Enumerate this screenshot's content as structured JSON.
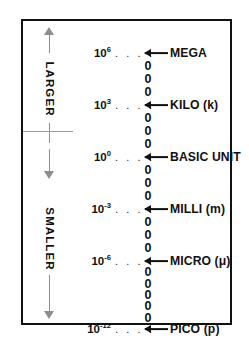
{
  "diagram": {
    "left_axis": {
      "upper_label": "LARGER",
      "lower_label": "SMALLER",
      "upper_arrow": "arrow-up",
      "lower_arrow": "arrow-down"
    },
    "dots": ". . . .",
    "rows": [
      {
        "base": "10",
        "exponent": "6",
        "prefix": "MEGA",
        "symbol": "",
        "y": 32,
        "zeros_below": 3
      },
      {
        "base": "10",
        "exponent": "3",
        "prefix": "KILO",
        "symbol": "(k)",
        "y": 84,
        "zeros_below": 3
      },
      {
        "base": "10",
        "exponent": "0",
        "prefix": "BASIC UNIT",
        "symbol": "",
        "y": 136,
        "zeros_below": 3
      },
      {
        "base": "10",
        "exponent": "-3",
        "prefix": "MILLI",
        "symbol": "(m)",
        "y": 188,
        "zeros_below": 3
      },
      {
        "base": "10",
        "exponent": "-6",
        "prefix": "MICRO",
        "symbol": "(μ)",
        "y": 240,
        "zeros_below": 5
      },
      {
        "base": "10",
        "exponent": "-12",
        "prefix": "PICO",
        "symbol": "(p)",
        "y": 308,
        "zeros_below": 0
      }
    ],
    "colors": {
      "frame": "#111111",
      "text": "#111111",
      "axis": "#8d8d8d",
      "divider": "#9a9a9a",
      "background": "#ffffff"
    }
  }
}
